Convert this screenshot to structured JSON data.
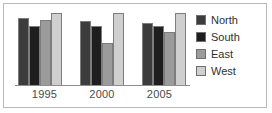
{
  "chart_data": {
    "type": "bar",
    "title": "",
    "subtitle": "",
    "xlabel": "",
    "ylabel": "",
    "categories": [
      "1995",
      "2000",
      "2005"
    ],
    "series": [
      {
        "name": "North",
        "color": "#3c3c3c",
        "values": [
          88,
          84,
          82
        ]
      },
      {
        "name": "South",
        "color": "#1e1e1e",
        "values": [
          78,
          78,
          78
        ]
      },
      {
        "name": "East",
        "color": "#9b9b9b",
        "values": [
          86,
          55,
          70
        ]
      },
      {
        "name": "West",
        "color": "#cfcfcf",
        "values": [
          95,
          95,
          95
        ]
      }
    ],
    "ylim": [
      0,
      100
    ],
    "grid": false,
    "legend_position": "right",
    "annotations": []
  },
  "legend": {
    "items": [
      {
        "label": "North",
        "color": "#3c3c3c"
      },
      {
        "label": "South",
        "color": "#1e1e1e"
      },
      {
        "label": "East",
        "color": "#9b9b9b"
      },
      {
        "label": "West",
        "color": "#cfcfcf"
      }
    ]
  },
  "axis": {
    "categories": [
      "1995",
      "2000",
      "2005"
    ]
  },
  "style": {
    "frame_border": "#b9b9b9",
    "axis_line": "#8d8d8d",
    "bar_outline": "#7d7d7d",
    "background": "#ffffff",
    "label_color": "#4a4a4a"
  }
}
